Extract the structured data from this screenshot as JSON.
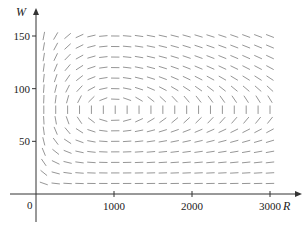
{
  "chart_data": {
    "type": "direction_field",
    "title": "",
    "xlabel": "R",
    "ylabel": "W",
    "origin_label": "0",
    "x_ticks": [
      1000,
      2000,
      3000
    ],
    "x_tick_labels": [
      "1000",
      "2000",
      "3000"
    ],
    "y_ticks": [
      50,
      100,
      150
    ],
    "y_tick_labels": [
      "50",
      "100",
      "150"
    ],
    "xlim": [
      0,
      3200
    ],
    "ylim": [
      0,
      165
    ],
    "grid": false,
    "legend": null,
    "field": {
      "description": "Predator-prey slope field dW/dR = (dW/dt)/(dR/dt)",
      "dR_dt": "0.08*R - 0.001*R*W",
      "dW_dt": "-0.02*W + 0.00002*R*W",
      "equilibrium": [
        1000,
        80
      ],
      "sample_R_range": [
        100,
        3000
      ],
      "sample_R_count": 20,
      "sample_W_range": [
        10,
        150
      ],
      "sample_W_count": 15
    },
    "colors": {
      "segments": "#8a8a8a",
      "axes": "#333333",
      "text": "#222222"
    }
  }
}
